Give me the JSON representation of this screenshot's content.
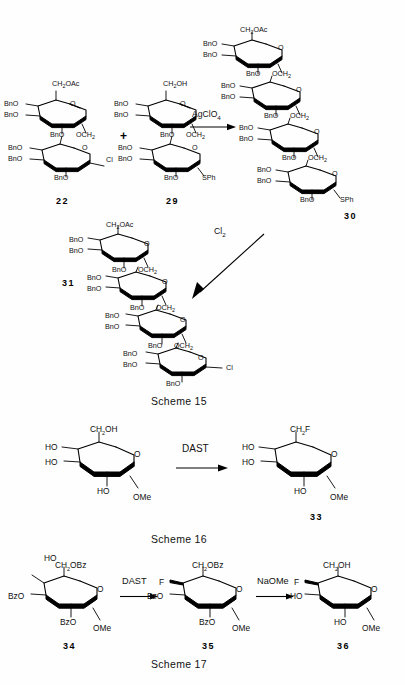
{
  "document": {
    "type": "chemistry-reaction-schemes",
    "background": "#fefefe",
    "ink": "#111111"
  },
  "schemes": [
    {
      "id": "scheme-15",
      "caption": "Scheme 15",
      "reagents": [
        "AgClO4",
        "Cl2"
      ],
      "compounds": [
        {
          "number": "22",
          "units": 2,
          "substituents": [
            "CH2OAc",
            "BnO",
            "BnO",
            "BnO",
            "OCH2",
            "BnO",
            "BnO",
            "BnO",
            "Cl"
          ],
          "terminus": "Cl"
        },
        {
          "number": "29",
          "units": 2,
          "substituents": [
            "CH2OH",
            "BnO",
            "BnO",
            "BnO",
            "OCH2",
            "BnO",
            "BnO",
            "BnO",
            "SPh"
          ],
          "terminus": "SPh"
        },
        {
          "number": "30",
          "units": 4,
          "substituents": [
            "CH2OAc",
            "BnO",
            "BnO",
            "BnO",
            "OCH2",
            "SPh"
          ],
          "terminus": "SPh"
        },
        {
          "number": "31",
          "units": 4,
          "substituents": [
            "CH2OAc",
            "BnO",
            "BnO",
            "BnO",
            "OCH2",
            "Cl"
          ],
          "terminus": "Cl"
        }
      ]
    },
    {
      "id": "scheme-16",
      "caption": "Scheme 16",
      "reagents": [
        "DAST"
      ],
      "compounds": [
        {
          "number": "",
          "units": 1,
          "substituents": [
            "CH2OH",
            "HO",
            "HO",
            "HO",
            "OMe"
          ],
          "terminus": "OMe"
        },
        {
          "number": "33",
          "units": 1,
          "substituents": [
            "CH2F",
            "HO",
            "HO",
            "HO",
            "OMe"
          ],
          "terminus": "OMe"
        }
      ]
    },
    {
      "id": "scheme-17",
      "caption": "Scheme 17",
      "reagents": [
        "DAST",
        "NaOMe"
      ],
      "compounds": [
        {
          "number": "34",
          "units": 1,
          "substituents": [
            "HO",
            "CH2OBz",
            "BzO",
            "BzO",
            "OMe"
          ],
          "terminus": "OMe"
        },
        {
          "number": "35",
          "units": 1,
          "substituents": [
            "CH2OBz",
            "F",
            "BzO",
            "BzO",
            "OMe"
          ],
          "terminus": "OMe"
        },
        {
          "number": "36",
          "units": 1,
          "substituents": [
            "CH2OH",
            "F",
            "HO",
            "HO",
            "OMe"
          ],
          "terminus": "OMe"
        }
      ]
    }
  ],
  "labels": {
    "ch2oac": "CH",
    "ch2oac_sub": "2",
    "ch2oac_rest": "OAc",
    "ch2oh": "CH",
    "ch2oh_sub": "2",
    "ch2oh_rest": "OH",
    "ch2f_rest": "F",
    "ch2obz_rest": "OBz",
    "bno": "BnO",
    "bzo": "BzO",
    "ho": "HO",
    "och2": "OCH",
    "och2_sub": "2",
    "sph": "SPh",
    "cl": "Cl",
    "f": "F",
    "ome": "OMe",
    "plus": "+"
  },
  "reagent_text": {
    "agclo4_main": "AgClO",
    "agclo4_sub": "4",
    "cl2_main": "Cl",
    "cl2_sub": "2",
    "dast": "DAST",
    "naome": "NaOMe"
  },
  "compound_numbers": {
    "n22": "22",
    "n29": "29",
    "n30": "30",
    "n31": "31",
    "n33": "33",
    "n34": "34",
    "n35": "35",
    "n36": "36"
  },
  "scheme_captions": {
    "s15": "Scheme 15",
    "s16": "Scheme 16",
    "s17": "Scheme 17"
  }
}
